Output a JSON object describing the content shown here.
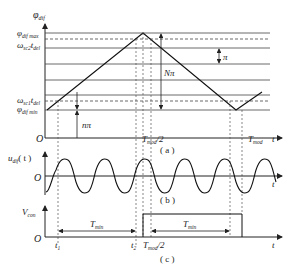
{
  "panel_a": {
    "caption": "( a )",
    "y_axis_label": "φ",
    "y_axis_sub": "dif",
    "labels": {
      "phi_max": "φ",
      "phi_max_sub": "dif max",
      "omega2": "ω",
      "omega2_sub": "sc2",
      "omega2_t": "t",
      "omega2_t_sub": "del",
      "omega1": "ω",
      "omega1_sub": "sc1",
      "omega1_t": "t",
      "omega1_t_sub": "del",
      "phi_min": "φ",
      "phi_min_sub": "dif min",
      "origin": "O",
      "n_pi": "nπ",
      "N_pi": "Nπ",
      "pi": "π",
      "t_mod_half": "T",
      "t_mod_half_sub": "mod",
      "t_mod_half_suffix": "/2",
      "t_mod": "T",
      "t_mod_sub": "mod",
      "t_axis": "t"
    }
  },
  "panel_b": {
    "caption": "( b )",
    "y_axis_label": "u",
    "y_axis_sub": "dif",
    "y_axis_arg": "( t )",
    "origin": "O",
    "t_axis": "t"
  },
  "panel_c": {
    "caption": "( c )",
    "y_axis_label": "V",
    "y_axis_sub": "con",
    "origin": "O",
    "t1": "t",
    "t1_sub": "1",
    "t2": "t",
    "t2_sub": "2",
    "t_mod_half": "T",
    "t_mod_half_sub": "mod",
    "t_mod_half_suffix": "/2",
    "t_min_1": "T",
    "t_min_1_sub": "min",
    "t_min_2": "T",
    "t_min_2_sub": "min",
    "t_axis": "t"
  }
}
